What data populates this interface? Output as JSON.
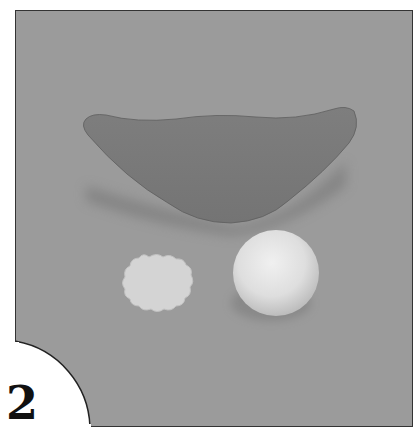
{
  "figure": {
    "step_number": "2",
    "objects": [
      {
        "name": "crescent-shape",
        "color": "#7a7a7a"
      },
      {
        "name": "scalloped-disc",
        "color": "#d6d6d6"
      },
      {
        "name": "sphere",
        "color": "#e4e4e4"
      }
    ],
    "colors": {
      "background": "#9b9b9b",
      "frame_border": "#333333",
      "page": "#ffffff",
      "number": "#111111"
    }
  }
}
